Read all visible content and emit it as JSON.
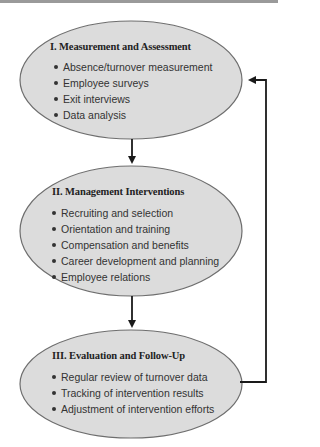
{
  "diagram": {
    "colors": {
      "ellipse_fill": "#dcdcdc",
      "ellipse_stroke": "#6e6e6e",
      "arrow": "#1a1a1a",
      "text": "#222222"
    },
    "stages": [
      {
        "title": "I. Measurement and Assessment",
        "items": [
          "Absence/turnover measurement",
          "Employee surveys",
          "Exit interviews",
          "Data analysis"
        ]
      },
      {
        "title": "II. Management Interventions",
        "items": [
          "Recruiting and selection",
          "Orientation and training",
          "Compensation and benefits",
          "Career development and planning",
          "Employee relations"
        ]
      },
      {
        "title": "III. Evaluation and Follow-Up",
        "items": [
          "Regular review of turnover data",
          "Tracking of intervention results",
          "Adjustment of intervention efforts"
        ]
      }
    ],
    "connections": [
      {
        "from": "stage-1",
        "to": "stage-2",
        "type": "arrow-down"
      },
      {
        "from": "stage-2",
        "to": "stage-3",
        "type": "arrow-down"
      },
      {
        "from": "stage-3",
        "to": "stage-1",
        "type": "feedback-loop"
      }
    ]
  }
}
